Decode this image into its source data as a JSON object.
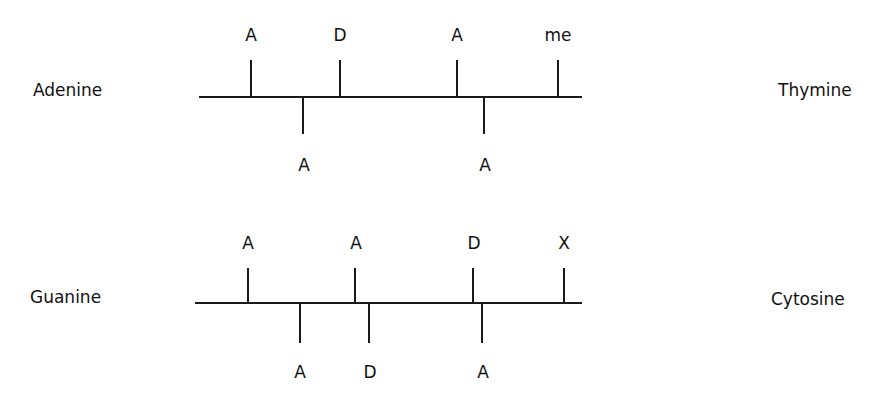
{
  "pairs": [
    {
      "left_base": "Adenine",
      "right_base": "Thymine",
      "top_labels": [
        "A",
        "D",
        "A",
        "me"
      ],
      "bottom_labels": [
        "A",
        "A"
      ]
    },
    {
      "left_base": "Guanine",
      "right_base": "Cytosine",
      "top_labels": [
        "A",
        "A",
        "D",
        "X"
      ],
      "bottom_labels": [
        "A",
        "D",
        "A"
      ]
    }
  ]
}
